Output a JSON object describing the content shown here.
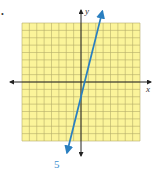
{
  "bullet": "•",
  "problem_number": "5",
  "colors": {
    "grid_fill": "#fbf49a",
    "grid_line": "#b5ad6a",
    "axis": "#222222",
    "line": "#2a7fc0",
    "label": "#3b8fd0"
  },
  "chart_data": {
    "type": "line",
    "title": "",
    "xlabel": "x",
    "ylabel": "y",
    "xlim": [
      -8,
      8
    ],
    "ylim": [
      -8,
      8
    ],
    "grid": true,
    "grid_step": 1,
    "axes_arrows": true,
    "line_arrows": true,
    "series": [
      {
        "name": "line",
        "equation": "y = 4x - 2",
        "x": [
          -1.5,
          0,
          0.5,
          1,
          2,
          2.5
        ],
        "y": [
          -8,
          -2,
          0,
          2,
          6,
          8
        ]
      }
    ]
  }
}
